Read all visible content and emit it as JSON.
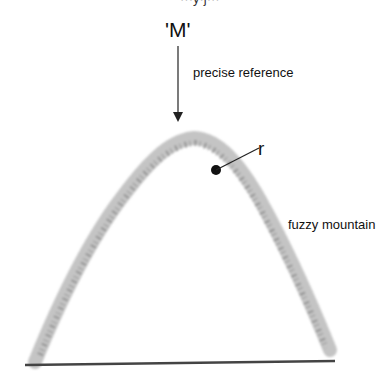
{
  "diagram": {
    "top_partial_text": "···y·j···",
    "m_label": "'M'",
    "reference_label": "precise reference",
    "point_label": "r",
    "mountain_label": "fuzzy mountain",
    "colors": {
      "text": "#111111",
      "mountain_speckle": "#9a9a9a",
      "baseline": "#444444",
      "arrow": "#222222"
    }
  }
}
